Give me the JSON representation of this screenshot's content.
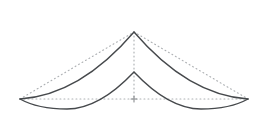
{
  "figure": {
    "canvas": {
      "width": 268,
      "height": 134,
      "background": "#ffffff"
    },
    "colors": {
      "solid": "#46494c",
      "dotted": "#aeb1b4",
      "cross": "#8a8d90"
    },
    "points": {
      "outer_apex": {
        "x": 134,
        "y": 32
      },
      "inner_apex": {
        "x": 134,
        "y": 72
      },
      "left_tip": {
        "x": 20,
        "y": 99
      },
      "right_tip": {
        "x": 248,
        "y": 99
      },
      "base_center": {
        "x": 134,
        "y": 99
      },
      "inner_left_min": {
        "x": 67,
        "y": 109
      },
      "inner_right_min": {
        "x": 201,
        "y": 109
      }
    },
    "paths": {
      "dotted_left_side": "M 20 99 L 134 32",
      "dotted_right_side": "M 134 32 L 248 99",
      "dotted_base": "M 20 99 L 248 99",
      "dotted_altitude": "M 134 32 L 134 99",
      "outer_curve": "M 20 99 Q 80 95 134 32 Q 188 95 248 99",
      "inner_curve": "M 20 99 Q 38 109 67 109 Q 99 109 134 72 Q 169 109 201 109 Q 230 109 248 99",
      "center_cross": "M 131 99 L 137 99 M 134 96 L 134 102"
    }
  }
}
